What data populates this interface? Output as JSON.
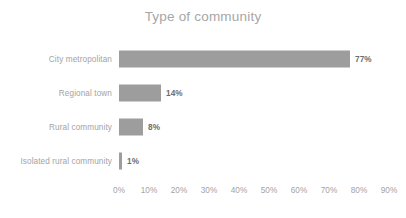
{
  "chart_data": {
    "type": "bar",
    "orientation": "horizontal",
    "title": "Type of community",
    "xlabel": "",
    "ylabel": "",
    "categories": [
      "City metropolitan",
      "Regional town",
      "Rural community",
      "Isolated rural community"
    ],
    "values": [
      77,
      14,
      8,
      1
    ],
    "value_labels": [
      "77%",
      "14%",
      "8%",
      "1%"
    ],
    "xlim": [
      0,
      90
    ],
    "xticks": [
      0,
      10,
      20,
      30,
      40,
      50,
      60,
      70,
      80,
      90
    ],
    "xtick_labels": [
      "0%",
      "10%",
      "20%",
      "30%",
      "40%",
      "50%",
      "60%",
      "70%",
      "80%",
      "90%"
    ],
    "grid": false,
    "legend": false,
    "colors": {
      "bar": "#9d9d9d",
      "title_text": "#a6a6a6",
      "axis_text": "#a3a3a3",
      "value_text": "#6d6d6d",
      "background": "#ffffff"
    }
  }
}
